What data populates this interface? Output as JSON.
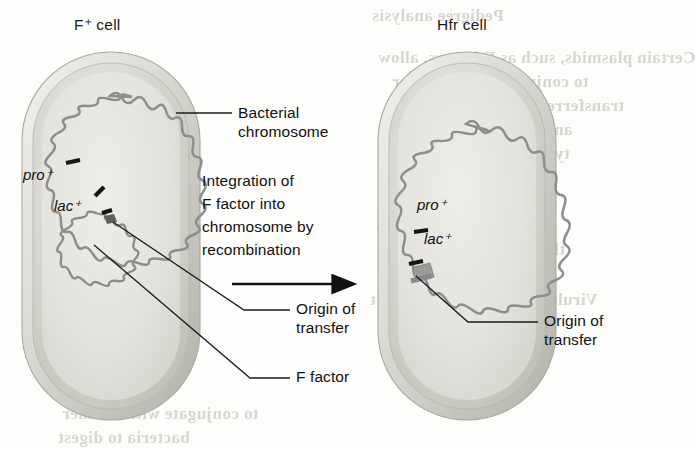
{
  "figure": {
    "type": "biology-diagram",
    "topic": "Integration of F factor into the bacterial chromosome converting an F+ cell into an Hfr cell",
    "background_color": "#fdfdfb"
  },
  "left_cell": {
    "title": "F⁺ cell",
    "title_plain": "F+ cell",
    "genes": [
      {
        "name": "pro",
        "superscript": "+",
        "label": "pro⁺"
      },
      {
        "name": "lac",
        "superscript": "+",
        "label": "lac⁺"
      }
    ],
    "structures": [
      "bacterial chromosome",
      "F factor plasmid",
      "origin of transfer"
    ]
  },
  "right_cell": {
    "title": "Hfr cell",
    "genes": [
      {
        "name": "pro",
        "superscript": "+",
        "label": "pro⁺"
      },
      {
        "name": "lac",
        "superscript": "+",
        "label": "lac⁺"
      }
    ],
    "structures": [
      "bacterial chromosome with integrated F factor",
      "origin of transfer"
    ]
  },
  "callouts": {
    "bacterial_chromosome": {
      "line1": "Bacterial",
      "line2": "chromosome"
    },
    "origin_of_transfer_left": {
      "line1": "Origin of",
      "line2": "transfer"
    },
    "f_factor": {
      "line1": "F factor"
    },
    "origin_of_transfer_right": {
      "line1": "Origin of",
      "line2": "transfer"
    }
  },
  "process": {
    "lines": [
      "Integration of",
      "F factor into",
      "chromosome by",
      "recombination"
    ],
    "arrow": "right-arrow"
  },
  "colors": {
    "cell_wall_outer": "#e3e2dd",
    "cell_wall_mid": "#c9c8c2",
    "cytoplasm": "#d2d1cb",
    "cytoplasm_light": "#e9e8e3",
    "dna": "#8e8e8e",
    "dna_dark": "#6f6f6f",
    "marker": "#171717",
    "f_factor_block": "#9a9a9a",
    "text": "#111111",
    "leader": "#1b1b1b"
  },
  "bleed_text": [
    "Pedigree analysis",
    "Certain plasmids, such as F factors, allow",
    "to conjugate with another",
    "transferred to the recipient cell",
    "ances that a plasmid is",
    "types of bacteria may",
    "Degradative plasmids",
    "bacteria to digest",
    "Colicinogenic plasmids",
    "that kill other bacteria",
    "Virulence plasmids genes that",
    "a pathogenic situation"
  ]
}
